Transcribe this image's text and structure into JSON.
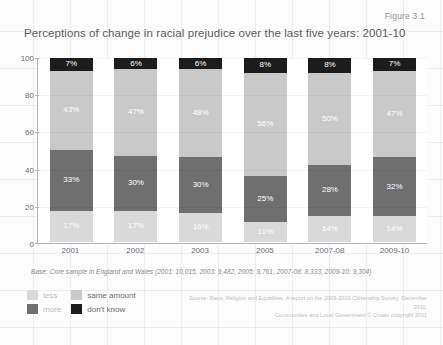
{
  "figure_label": "Figure 3.1",
  "title": "Perceptions of change in racial prejudice over the last five years: 2001-10",
  "base_note": "Base: Core sample in England and Wales (2001: 10,015, 2003: 9,482, 2005: 9,761, 2007-08: 8,333, 2009-10: 9,304)",
  "source_note_line1": "Source: Race, Religion and Equalities: A report on the 2009-2010 Citizenship Survey, December 2011,",
  "source_note_line2": "Communities and Local Government © Crown copyright 2011",
  "legend": {
    "items": [
      {
        "label": "less",
        "color": "#d9d9d9"
      },
      {
        "label": "same amount",
        "color": "#c9c9c9"
      },
      {
        "label": "more",
        "color": "#6f6f6f"
      },
      {
        "label": "don't know",
        "color": "#1c1c1c"
      }
    ]
  },
  "chart_data": {
    "type": "bar",
    "subtype": "stacked-100-percent",
    "title": "Perceptions of change in racial prejudice over the last five years: 2001-10",
    "xlabel": "",
    "ylabel": "",
    "ylim": [
      0,
      100
    ],
    "yticks": [
      0,
      20,
      40,
      60,
      80,
      100
    ],
    "ytick_labels": [
      "0",
      "20",
      "40",
      "60",
      "80",
      "100"
    ],
    "grid": true,
    "legend_position": "bottom-left",
    "categories": [
      "2001",
      "2002",
      "2003",
      "2005",
      "2007-08",
      "2009-10"
    ],
    "series": [
      {
        "name": "less",
        "color": "#d9d9d9",
        "values": [
          17,
          17,
          16,
          11,
          14,
          14
        ],
        "labels": [
          "17%",
          "17%",
          "16%",
          "11%",
          "14%",
          "14%"
        ]
      },
      {
        "name": "more",
        "color": "#6f6f6f",
        "values": [
          33,
          30,
          30,
          25,
          28,
          32
        ],
        "labels": [
          "33%",
          "30%",
          "30%",
          "25%",
          "28%",
          "32%"
        ]
      },
      {
        "name": "same amount",
        "color": "#c9c9c9",
        "values": [
          43,
          47,
          48,
          56,
          50,
          47
        ],
        "labels": [
          "43%",
          "47%",
          "48%",
          "56%",
          "50%",
          "47%"
        ]
      },
      {
        "name": "don't know",
        "color": "#1c1c1c",
        "values": [
          7,
          6,
          6,
          8,
          8,
          7
        ],
        "labels": [
          "7%",
          "6%",
          "6%",
          "8%",
          "8%",
          "7%"
        ]
      }
    ]
  }
}
